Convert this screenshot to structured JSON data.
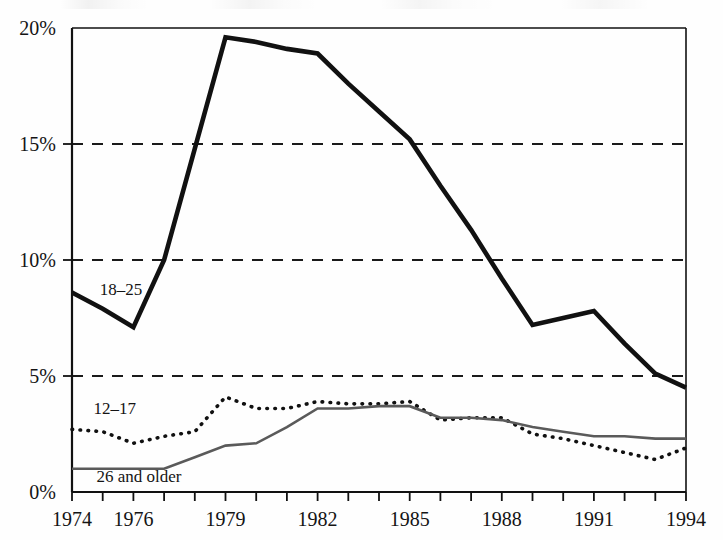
{
  "chart_data": {
    "type": "line",
    "title": "",
    "xlabel": "",
    "ylabel": "",
    "x": [
      1974,
      1975,
      1976,
      1977,
      1978,
      1979,
      1980,
      1981,
      1982,
      1983,
      1984,
      1985,
      1986,
      1987,
      1988,
      1989,
      1990,
      1991,
      1992,
      1993,
      1994
    ],
    "xlim": [
      1974,
      1994
    ],
    "ylim": [
      0,
      20
    ],
    "grid": "horizontal-dashed",
    "legend_position": "inline-labels",
    "x_tick_values": [
      1974,
      1975,
      1976,
      1977,
      1978,
      1979,
      1980,
      1981,
      1982,
      1983,
      1984,
      1985,
      1986,
      1987,
      1988,
      1989,
      1990,
      1991,
      1992,
      1993,
      1994
    ],
    "x_tick_labels": [
      "1974",
      "1976",
      "1979",
      "1982",
      "1985",
      "1988",
      "1991",
      "1994"
    ],
    "x_labeled_values": [
      1974,
      1976,
      1979,
      1982,
      1985,
      1988,
      1991,
      1994
    ],
    "y_tick_values": [
      0,
      5,
      10,
      15,
      20
    ],
    "y_tick_labels": [
      "0%",
      "5%",
      "10%",
      "15%",
      "20%"
    ],
    "gridline_values": [
      5,
      10,
      15
    ],
    "series": [
      {
        "name": "18–25",
        "label": "18–25",
        "style": "thick-solid-black",
        "color": "#111111",
        "values": [
          8.6,
          7.9,
          7.1,
          10.0,
          14.8,
          19.6,
          19.4,
          19.1,
          18.9,
          17.6,
          16.4,
          15.2,
          13.2,
          11.3,
          9.2,
          7.2,
          7.5,
          7.8,
          6.4,
          5.1,
          4.5
        ]
      },
      {
        "name": "12–17",
        "label": "12–17",
        "style": "dotted-black",
        "color": "#111111",
        "values": [
          2.7,
          2.6,
          2.1,
          2.4,
          2.6,
          4.1,
          3.6,
          3.6,
          3.9,
          3.8,
          3.8,
          3.9,
          3.1,
          3.2,
          3.2,
          2.5,
          2.3,
          2.0,
          1.7,
          1.4,
          1.9
        ]
      },
      {
        "name": "26 and older",
        "label": "26 and older",
        "style": "thin-solid-gray",
        "color": "#5a5a5a",
        "values": [
          1.0,
          1.0,
          1.0,
          1.0,
          1.5,
          2.0,
          2.1,
          2.8,
          3.6,
          3.6,
          3.7,
          3.7,
          3.2,
          3.2,
          3.1,
          2.8,
          2.6,
          2.4,
          2.4,
          2.3,
          2.3
        ]
      }
    ]
  },
  "axes": {
    "y_axis_name": "percent-axis",
    "x_axis_name": "year-axis"
  },
  "annotations": {
    "series_labels": [
      {
        "text": "18–25",
        "x": 1974.9,
        "y": 8.5
      },
      {
        "text": "12–17",
        "x": 1974.7,
        "y": 3.35
      },
      {
        "text": "26 and older",
        "x": 1974.8,
        "y": 0.45
      }
    ]
  }
}
